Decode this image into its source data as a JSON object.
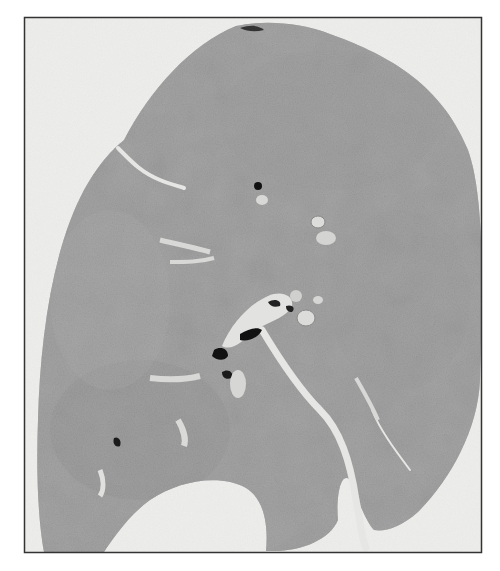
{
  "figure": {
    "colors": {
      "page_background": "#ffffff",
      "frame_background": "#eeeeec",
      "frame_border": "#333333",
      "tissue": "#9c9c9c",
      "tissue_dark": "#7e7e7e",
      "fissure": "#e6e6e4",
      "airway_lumen": "#111111",
      "vessel": "#dcdcdc"
    }
  }
}
